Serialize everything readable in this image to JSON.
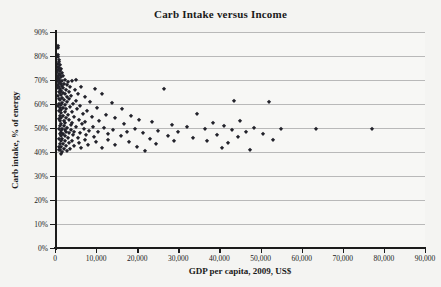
{
  "chart_data": {
    "type": "scatter",
    "title": "Carb Intake versus Income",
    "xlabel": "GDP per capita, 2009, US$",
    "ylabel": "Carb intake, % of energy",
    "xlim": [
      0,
      90000
    ],
    "ylim": [
      0,
      0.9
    ],
    "grid": true,
    "legend": "none",
    "marker": "diamond",
    "marker_color": "#23232b",
    "gridline_color": "#b9b9b9",
    "background_color": "#f4f4f2",
    "x_ticks": [
      0,
      10000,
      20000,
      30000,
      40000,
      50000,
      60000,
      70000,
      80000,
      90000
    ],
    "x_tick_labels": [
      "0",
      "10,000",
      "20,000",
      "30,000",
      "40,000",
      "50,000",
      "60,000",
      "70,000",
      "80,000",
      "90,000"
    ],
    "y_ticks": [
      0,
      0.1,
      0.2,
      0.3,
      0.4,
      0.5,
      0.6,
      0.7,
      0.8,
      0.9
    ],
    "y_tick_labels": [
      "0%",
      "10%",
      "20%",
      "30%",
      "40%",
      "50%",
      "60%",
      "70%",
      "80%",
      "90%"
    ],
    "points": [
      [
        700,
        0.835
      ],
      [
        760,
        0.842
      ],
      [
        820,
        0.805
      ],
      [
        650,
        0.795
      ],
      [
        900,
        0.785
      ],
      [
        1050,
        0.775
      ],
      [
        700,
        0.768
      ],
      [
        1200,
        0.762
      ],
      [
        620,
        0.755
      ],
      [
        980,
        0.752
      ],
      [
        1400,
        0.748
      ],
      [
        760,
        0.742
      ],
      [
        1100,
        0.738
      ],
      [
        540,
        0.735
      ],
      [
        1650,
        0.73
      ],
      [
        880,
        0.726
      ],
      [
        1300,
        0.722
      ],
      [
        600,
        0.718
      ],
      [
        2000,
        0.715
      ],
      [
        1500,
        0.712
      ],
      [
        700,
        0.708
      ],
      [
        1050,
        0.705
      ],
      [
        2400,
        0.702
      ],
      [
        840,
        0.7
      ],
      [
        1750,
        0.698
      ],
      [
        560,
        0.695
      ],
      [
        1200,
        0.692
      ],
      [
        3100,
        0.69
      ],
      [
        920,
        0.688
      ],
      [
        2200,
        0.685
      ],
      [
        1400,
        0.682
      ],
      [
        680,
        0.68
      ],
      [
        4200,
        0.695
      ],
      [
        5200,
        0.7
      ],
      [
        2800,
        0.678
      ],
      [
        1600,
        0.675
      ],
      [
        1000,
        0.672
      ],
      [
        3600,
        0.67
      ],
      [
        760,
        0.668
      ],
      [
        2000,
        0.665
      ],
      [
        1250,
        0.662
      ],
      [
        4800,
        0.66
      ],
      [
        6300,
        0.672
      ],
      [
        2600,
        0.658
      ],
      [
        1450,
        0.655
      ],
      [
        880,
        0.652
      ],
      [
        3300,
        0.65
      ],
      [
        9800,
        0.662
      ],
      [
        1900,
        0.648
      ],
      [
        1100,
        0.645
      ],
      [
        5600,
        0.642
      ],
      [
        2300,
        0.64
      ],
      [
        1350,
        0.638
      ],
      [
        700,
        0.635
      ],
      [
        4000,
        0.633
      ],
      [
        7200,
        0.63
      ],
      [
        2800,
        0.628
      ],
      [
        1600,
        0.626
      ],
      [
        980,
        0.623
      ],
      [
        3400,
        0.62
      ],
      [
        26500,
        0.662
      ],
      [
        11500,
        0.64
      ],
      [
        2100,
        0.618
      ],
      [
        1250,
        0.615
      ],
      [
        5000,
        0.612
      ],
      [
        8400,
        0.61
      ],
      [
        2900,
        0.608
      ],
      [
        1700,
        0.605
      ],
      [
        1050,
        0.602
      ],
      [
        4300,
        0.6
      ],
      [
        13800,
        0.605
      ],
      [
        2400,
        0.598
      ],
      [
        1450,
        0.595
      ],
      [
        820,
        0.592
      ],
      [
        6100,
        0.59
      ],
      [
        3700,
        0.588
      ],
      [
        2000,
        0.585
      ],
      [
        1200,
        0.582
      ],
      [
        10200,
        0.585
      ],
      [
        5400,
        0.58
      ],
      [
        2700,
        0.578
      ],
      [
        1550,
        0.575
      ],
      [
        900,
        0.572
      ],
      [
        7800,
        0.57
      ],
      [
        4100,
        0.568
      ],
      [
        2300,
        0.565
      ],
      [
        1350,
        0.562
      ],
      [
        16200,
        0.578
      ],
      [
        43500,
        0.612
      ],
      [
        52000,
        0.608
      ],
      [
        6700,
        0.558
      ],
      [
        3200,
        0.555
      ],
      [
        1900,
        0.552
      ],
      [
        1100,
        0.55
      ],
      [
        12400,
        0.555
      ],
      [
        8900,
        0.548
      ],
      [
        4700,
        0.545
      ],
      [
        2600,
        0.542
      ],
      [
        1500,
        0.54
      ],
      [
        950,
        0.538
      ],
      [
        18500,
        0.552
      ],
      [
        5900,
        0.535
      ],
      [
        3500,
        0.532
      ],
      [
        2100,
        0.53
      ],
      [
        1250,
        0.528
      ],
      [
        14600,
        0.54
      ],
      [
        7400,
        0.525
      ],
      [
        4200,
        0.522
      ],
      [
        2400,
        0.52
      ],
      [
        1400,
        0.518
      ],
      [
        10800,
        0.528
      ],
      [
        20500,
        0.532
      ],
      [
        34500,
        0.558
      ],
      [
        6500,
        0.515
      ],
      [
        3800,
        0.512
      ],
      [
        2200,
        0.51
      ],
      [
        1300,
        0.508
      ],
      [
        23500,
        0.525
      ],
      [
        16800,
        0.518
      ],
      [
        9200,
        0.505
      ],
      [
        5100,
        0.503
      ],
      [
        2900,
        0.5
      ],
      [
        1700,
        0.498
      ],
      [
        1000,
        0.496
      ],
      [
        28500,
        0.512
      ],
      [
        38500,
        0.522
      ],
      [
        45000,
        0.528
      ],
      [
        12000,
        0.5
      ],
      [
        7000,
        0.495
      ],
      [
        4000,
        0.492
      ],
      [
        2300,
        0.49
      ],
      [
        1350,
        0.488
      ],
      [
        32000,
        0.505
      ],
      [
        41000,
        0.508
      ],
      [
        48500,
        0.5
      ],
      [
        19500,
        0.495
      ],
      [
        14000,
        0.492
      ],
      [
        8200,
        0.488
      ],
      [
        4600,
        0.485
      ],
      [
        2700,
        0.483
      ],
      [
        1550,
        0.48
      ],
      [
        36500,
        0.495
      ],
      [
        43000,
        0.492
      ],
      [
        55000,
        0.498
      ],
      [
        63500,
        0.498
      ],
      [
        77000,
        0.498
      ],
      [
        25000,
        0.488
      ],
      [
        17500,
        0.485
      ],
      [
        10500,
        0.482
      ],
      [
        6000,
        0.48
      ],
      [
        3400,
        0.478
      ],
      [
        2000,
        0.476
      ],
      [
        1200,
        0.474
      ],
      [
        30000,
        0.482
      ],
      [
        46500,
        0.485
      ],
      [
        21500,
        0.478
      ],
      [
        13000,
        0.475
      ],
      [
        7600,
        0.472
      ],
      [
        4400,
        0.47
      ],
      [
        2500,
        0.468
      ],
      [
        1450,
        0.466
      ],
      [
        39500,
        0.472
      ],
      [
        50500,
        0.475
      ],
      [
        27500,
        0.468
      ],
      [
        16000,
        0.465
      ],
      [
        9500,
        0.462
      ],
      [
        5500,
        0.46
      ],
      [
        3100,
        0.458
      ],
      [
        1800,
        0.456
      ],
      [
        1050,
        0.454
      ],
      [
        33500,
        0.458
      ],
      [
        44500,
        0.462
      ],
      [
        23000,
        0.455
      ],
      [
        12800,
        0.452
      ],
      [
        7200,
        0.45
      ],
      [
        4100,
        0.448
      ],
      [
        2300,
        0.446
      ],
      [
        1350,
        0.444
      ],
      [
        37000,
        0.448
      ],
      [
        53000,
        0.452
      ],
      [
        29000,
        0.445
      ],
      [
        18000,
        0.442
      ],
      [
        10000,
        0.44
      ],
      [
        5800,
        0.438
      ],
      [
        3300,
        0.436
      ],
      [
        1900,
        0.434
      ],
      [
        1150,
        0.432
      ],
      [
        42000,
        0.438
      ],
      [
        24500,
        0.432
      ],
      [
        14500,
        0.43
      ],
      [
        8000,
        0.428
      ],
      [
        4700,
        0.426
      ],
      [
        2600,
        0.424
      ],
      [
        1500,
        0.422
      ],
      [
        900,
        0.42
      ],
      [
        20000,
        0.42
      ],
      [
        11500,
        0.418
      ],
      [
        6400,
        0.416
      ],
      [
        3600,
        0.414
      ],
      [
        2100,
        0.412
      ],
      [
        1250,
        0.41
      ],
      [
        40500,
        0.418
      ],
      [
        1050,
        0.408
      ],
      [
        2900,
        0.405
      ],
      [
        1700,
        0.402
      ],
      [
        1400,
        0.392
      ],
      [
        22000,
        0.405
      ],
      [
        47500,
        0.41
      ]
    ],
    "n_points": 205
  }
}
